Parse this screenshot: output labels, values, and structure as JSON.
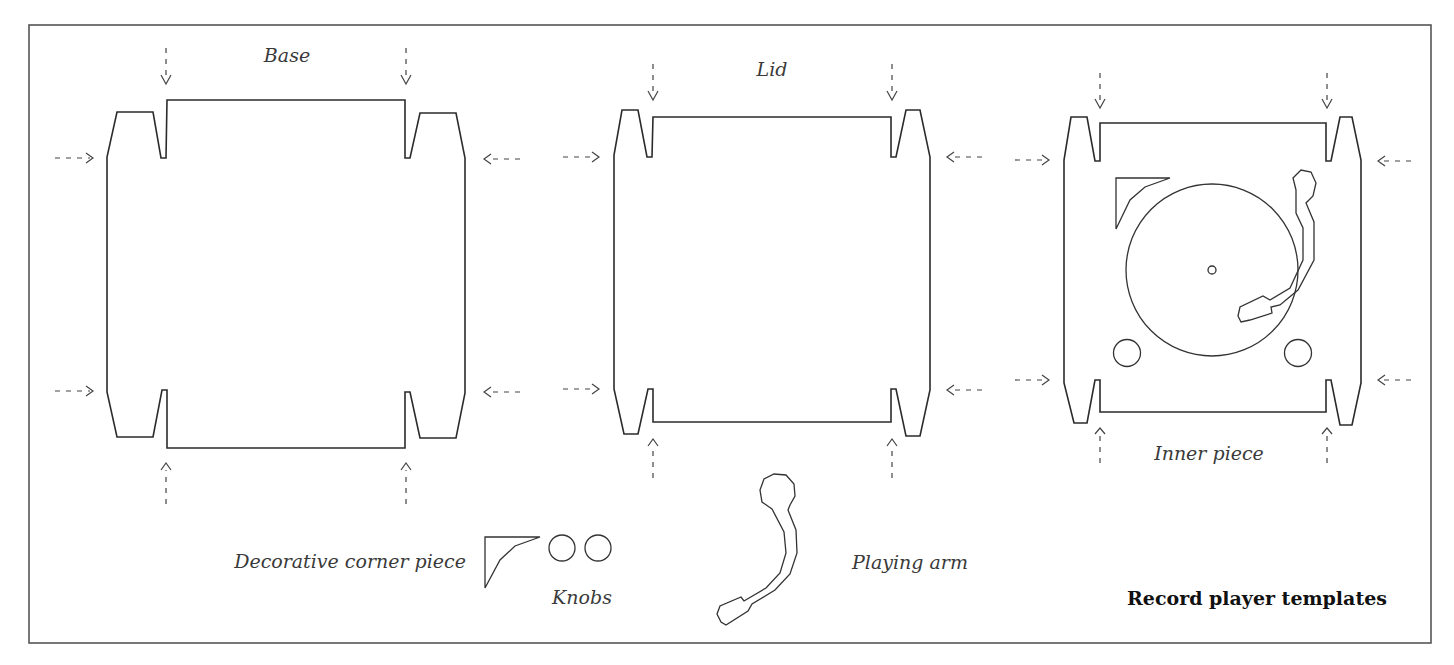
{
  "figure": {
    "title": "Record player templates",
    "frame": {
      "x": 29,
      "y": 25,
      "w": 1402,
      "h": 618
    },
    "colors": {
      "line": "#2b2b2b",
      "frame": "#555555",
      "label": "#3a3a3a",
      "background": "#ffffff"
    }
  },
  "pieces": [
    {
      "id": "base",
      "label": "Base"
    },
    {
      "id": "lid",
      "label": "Lid"
    },
    {
      "id": "inner",
      "label": "Inner piece"
    }
  ],
  "parts": {
    "corner_label": "Decorative corner piece",
    "knobs_label": "Knobs",
    "arm_label": "Playing arm"
  },
  "legend": {
    "fold_arrow": "dashed-arrow-icon"
  }
}
